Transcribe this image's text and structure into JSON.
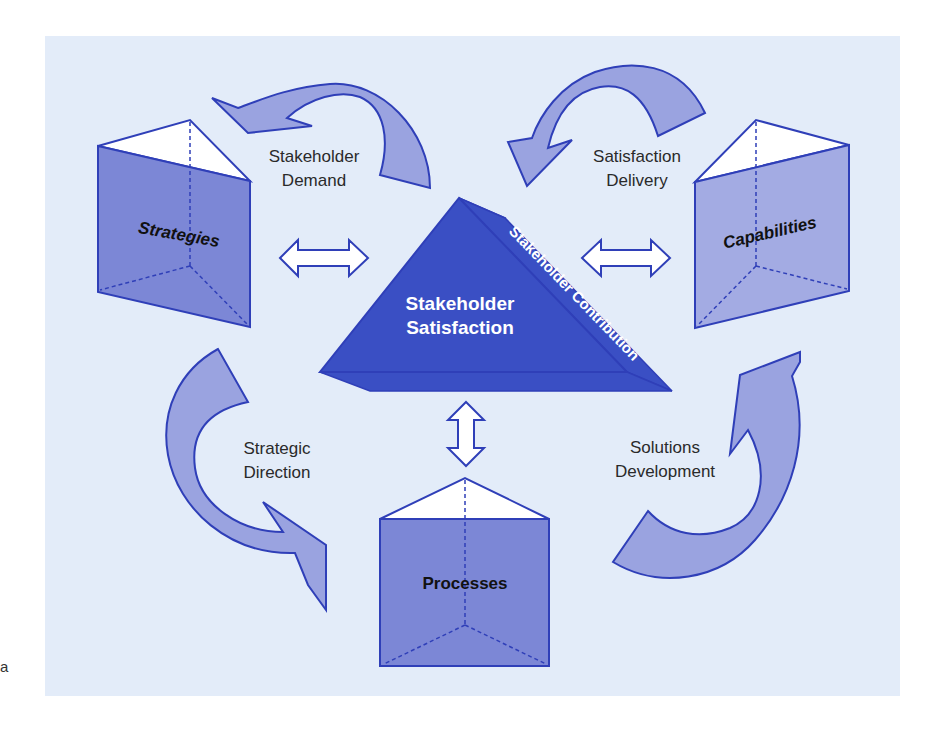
{
  "diagram": {
    "center": {
      "title_line1": "Stakeholder",
      "title_line2": "Satisfaction",
      "edge_label": "Stakeholder Contribution"
    },
    "prisms": {
      "strategies": "Strategies",
      "capabilities": "Capabilities",
      "processes": "Processes"
    },
    "flows": {
      "stakeholder_demand": {
        "line1": "Stakeholder",
        "line2": "Demand"
      },
      "satisfaction_delivery": {
        "line1": "Satisfaction",
        "line2": "Delivery"
      },
      "strategic_direction": {
        "line1": "Strategic",
        "line2": "Direction"
      },
      "solutions_development": {
        "line1": "Solutions",
        "line2": "Development"
      }
    },
    "margin_text": "a",
    "colors": {
      "background": "#e3ecf9",
      "center_fill": "#3a4fc4",
      "prism_fill": "#7c87d6",
      "prism_fill_light": "#a3abe3",
      "arrow_fill": "#9aa3e0",
      "stroke": "#2f3fb8"
    }
  }
}
